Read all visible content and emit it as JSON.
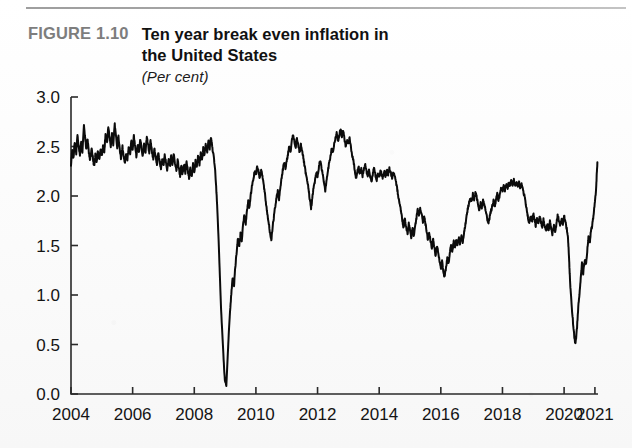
{
  "figure": {
    "label": "FIGURE 1.10",
    "title_line1": "Ten year break even inflation in",
    "title_line2": "the United States",
    "units": "(Per cent)"
  },
  "colors": {
    "line": "#0b0b0b",
    "axis": "#2a2a2a",
    "label_gray": "#7d7d7d",
    "text": "#111111",
    "background": "#fdfdfd"
  },
  "chart_data": {
    "type": "line",
    "title": "Ten year break even inflation in the United States",
    "subtitle": "(Per cent)",
    "xlabel": "",
    "ylabel": "Per cent",
    "xlim": [
      2004,
      2021.1
    ],
    "ylim": [
      0.0,
      3.0
    ],
    "yticks": [
      0.0,
      0.5,
      1.0,
      1.5,
      2.0,
      2.5,
      3.0
    ],
    "ytick_labels": [
      "0.0",
      "0.5",
      "1.0",
      "1.5",
      "2.0",
      "2.5",
      "3.0"
    ],
    "xticks": [
      2004,
      2006,
      2008,
      2010,
      2012,
      2014,
      2016,
      2018,
      2020,
      2021
    ],
    "xtick_labels": [
      "2004",
      "2006",
      "2008",
      "2010",
      "2012",
      "2014",
      "2016",
      "2018",
      "2020",
      "2021"
    ],
    "grid": false,
    "legend": false,
    "series": [
      {
        "name": "Ten year break even inflation",
        "units": "per cent",
        "x": [
          2004.0,
          2004.04,
          2004.08,
          2004.12,
          2004.17,
          2004.21,
          2004.25,
          2004.29,
          2004.33,
          2004.37,
          2004.42,
          2004.46,
          2004.5,
          2004.54,
          2004.58,
          2004.62,
          2004.67,
          2004.71,
          2004.75,
          2004.79,
          2004.83,
          2004.87,
          2004.92,
          2004.96,
          2005.0,
          2005.04,
          2005.08,
          2005.12,
          2005.17,
          2005.21,
          2005.25,
          2005.29,
          2005.33,
          2005.37,
          2005.42,
          2005.46,
          2005.5,
          2005.54,
          2005.58,
          2005.62,
          2005.67,
          2005.71,
          2005.75,
          2005.79,
          2005.83,
          2005.87,
          2005.92,
          2005.96,
          2006.0,
          2006.04,
          2006.08,
          2006.12,
          2006.17,
          2006.21,
          2006.25,
          2006.29,
          2006.33,
          2006.37,
          2006.42,
          2006.46,
          2006.5,
          2006.54,
          2006.58,
          2006.62,
          2006.67,
          2006.71,
          2006.75,
          2006.79,
          2006.83,
          2006.87,
          2006.92,
          2006.96,
          2007.0,
          2007.04,
          2007.08,
          2007.12,
          2007.17,
          2007.21,
          2007.25,
          2007.29,
          2007.33,
          2007.37,
          2007.42,
          2007.46,
          2007.5,
          2007.54,
          2007.58,
          2007.62,
          2007.67,
          2007.71,
          2007.75,
          2007.79,
          2007.83,
          2007.87,
          2007.92,
          2007.96,
          2008.0,
          2008.04,
          2008.08,
          2008.12,
          2008.17,
          2008.21,
          2008.25,
          2008.29,
          2008.33,
          2008.37,
          2008.42,
          2008.46,
          2008.5,
          2008.54,
          2008.58,
          2008.62,
          2008.67,
          2008.71,
          2008.75,
          2008.79,
          2008.83,
          2008.87,
          2008.92,
          2008.96,
          2009.0,
          2009.04,
          2009.08,
          2009.12,
          2009.17,
          2009.21,
          2009.25,
          2009.29,
          2009.33,
          2009.37,
          2009.42,
          2009.46,
          2009.5,
          2009.54,
          2009.58,
          2009.62,
          2009.67,
          2009.71,
          2009.75,
          2009.79,
          2009.83,
          2009.87,
          2009.92,
          2009.96,
          2010.0,
          2010.04,
          2010.08,
          2010.12,
          2010.17,
          2010.21,
          2010.25,
          2010.29,
          2010.33,
          2010.37,
          2010.42,
          2010.46,
          2010.5,
          2010.54,
          2010.58,
          2010.62,
          2010.67,
          2010.71,
          2010.75,
          2010.79,
          2010.83,
          2010.87,
          2010.92,
          2010.96,
          2011.0,
          2011.04,
          2011.08,
          2011.12,
          2011.17,
          2011.21,
          2011.25,
          2011.29,
          2011.33,
          2011.37,
          2011.42,
          2011.46,
          2011.5,
          2011.54,
          2011.58,
          2011.62,
          2011.67,
          2011.71,
          2011.75,
          2011.79,
          2011.83,
          2011.87,
          2011.92,
          2011.96,
          2012.0,
          2012.04,
          2012.08,
          2012.12,
          2012.17,
          2012.21,
          2012.25,
          2012.29,
          2012.33,
          2012.37,
          2012.42,
          2012.46,
          2012.5,
          2012.54,
          2012.58,
          2012.62,
          2012.67,
          2012.71,
          2012.75,
          2012.79,
          2012.83,
          2012.87,
          2012.92,
          2012.96,
          2013.0,
          2013.04,
          2013.08,
          2013.12,
          2013.17,
          2013.21,
          2013.25,
          2013.29,
          2013.33,
          2013.37,
          2013.42,
          2013.46,
          2013.5,
          2013.54,
          2013.58,
          2013.62,
          2013.67,
          2013.71,
          2013.75,
          2013.79,
          2013.83,
          2013.87,
          2013.92,
          2013.96,
          2014.0,
          2014.04,
          2014.08,
          2014.12,
          2014.17,
          2014.21,
          2014.25,
          2014.29,
          2014.33,
          2014.37,
          2014.42,
          2014.46,
          2014.5,
          2014.54,
          2014.58,
          2014.62,
          2014.67,
          2014.71,
          2014.75,
          2014.79,
          2014.83,
          2014.87,
          2014.92,
          2014.96,
          2015.0,
          2015.04,
          2015.08,
          2015.12,
          2015.17,
          2015.21,
          2015.25,
          2015.29,
          2015.33,
          2015.37,
          2015.42,
          2015.46,
          2015.5,
          2015.54,
          2015.58,
          2015.62,
          2015.67,
          2015.71,
          2015.75,
          2015.79,
          2015.83,
          2015.87,
          2015.92,
          2015.96,
          2016.0,
          2016.04,
          2016.08,
          2016.12,
          2016.17,
          2016.21,
          2016.25,
          2016.29,
          2016.33,
          2016.37,
          2016.42,
          2016.46,
          2016.5,
          2016.54,
          2016.58,
          2016.62,
          2016.67,
          2016.71,
          2016.75,
          2016.79,
          2016.83,
          2016.87,
          2016.92,
          2016.96,
          2017.0,
          2017.04,
          2017.08,
          2017.12,
          2017.17,
          2017.21,
          2017.25,
          2017.29,
          2017.33,
          2017.37,
          2017.42,
          2017.46,
          2017.5,
          2017.54,
          2017.58,
          2017.62,
          2017.67,
          2017.71,
          2017.75,
          2017.79,
          2017.83,
          2017.87,
          2017.92,
          2017.96,
          2018.0,
          2018.04,
          2018.08,
          2018.12,
          2018.17,
          2018.21,
          2018.25,
          2018.29,
          2018.33,
          2018.37,
          2018.42,
          2018.46,
          2018.5,
          2018.54,
          2018.58,
          2018.62,
          2018.67,
          2018.71,
          2018.75,
          2018.79,
          2018.83,
          2018.87,
          2018.92,
          2018.96,
          2019.0,
          2019.04,
          2019.08,
          2019.12,
          2019.17,
          2019.21,
          2019.25,
          2019.29,
          2019.33,
          2019.37,
          2019.42,
          2019.46,
          2019.5,
          2019.54,
          2019.58,
          2019.62,
          2019.67,
          2019.71,
          2019.75,
          2019.79,
          2019.83,
          2019.87,
          2019.92,
          2019.96,
          2020.0,
          2020.04,
          2020.08,
          2020.12,
          2020.14,
          2020.16,
          2020.18,
          2020.21,
          2020.25,
          2020.29,
          2020.33,
          2020.37,
          2020.42,
          2020.46,
          2020.5,
          2020.54,
          2020.58,
          2020.62,
          2020.67,
          2020.71,
          2020.75,
          2020.79,
          2020.83,
          2020.87,
          2020.92,
          2020.96,
          2021.0,
          2021.04,
          2021.06,
          2021.08
        ],
        "y": [
          2.32,
          2.46,
          2.38,
          2.55,
          2.42,
          2.62,
          2.5,
          2.4,
          2.55,
          2.44,
          2.72,
          2.58,
          2.47,
          2.58,
          2.44,
          2.36,
          2.48,
          2.38,
          2.3,
          2.42,
          2.33,
          2.45,
          2.37,
          2.47,
          2.4,
          2.52,
          2.44,
          2.62,
          2.54,
          2.7,
          2.6,
          2.5,
          2.62,
          2.52,
          2.72,
          2.6,
          2.48,
          2.6,
          2.48,
          2.38,
          2.5,
          2.4,
          2.32,
          2.44,
          2.36,
          2.5,
          2.42,
          2.56,
          2.48,
          2.6,
          2.5,
          2.4,
          2.52,
          2.44,
          2.58,
          2.48,
          2.4,
          2.52,
          2.44,
          2.6,
          2.52,
          2.44,
          2.56,
          2.46,
          2.38,
          2.48,
          2.4,
          2.32,
          2.44,
          2.36,
          2.28,
          2.38,
          2.3,
          2.42,
          2.34,
          2.26,
          2.38,
          2.3,
          2.4,
          2.32,
          2.42,
          2.34,
          2.26,
          2.36,
          2.28,
          2.2,
          2.3,
          2.22,
          2.32,
          2.24,
          2.34,
          2.26,
          2.18,
          2.28,
          2.2,
          2.32,
          2.24,
          2.36,
          2.28,
          2.4,
          2.32,
          2.44,
          2.36,
          2.48,
          2.4,
          2.52,
          2.44,
          2.56,
          2.48,
          2.6,
          2.5,
          2.42,
          2.3,
          2.1,
          1.85,
          1.55,
          1.2,
          0.85,
          0.55,
          0.3,
          0.12,
          0.08,
          0.35,
          0.62,
          0.88,
          1.05,
          1.18,
          1.1,
          1.28,
          1.42,
          1.58,
          1.5,
          1.62,
          1.55,
          1.7,
          1.8,
          1.72,
          1.85,
          1.95,
          1.88,
          2.0,
          2.1,
          2.18,
          2.25,
          2.22,
          2.3,
          2.26,
          2.18,
          2.28,
          2.2,
          2.12,
          2.02,
          1.92,
          1.82,
          1.72,
          1.62,
          1.56,
          1.68,
          1.78,
          1.88,
          1.98,
          2.05,
          1.96,
          2.08,
          2.18,
          2.26,
          2.34,
          2.28,
          2.36,
          2.42,
          2.5,
          2.44,
          2.56,
          2.62,
          2.54,
          2.48,
          2.58,
          2.52,
          2.44,
          2.52,
          2.46,
          2.38,
          2.3,
          2.22,
          2.14,
          2.06,
          1.96,
          1.88,
          1.98,
          2.08,
          2.16,
          2.24,
          2.2,
          2.28,
          2.36,
          2.3,
          2.22,
          2.14,
          2.06,
          2.16,
          2.24,
          2.32,
          2.4,
          2.48,
          2.44,
          2.52,
          2.58,
          2.64,
          2.56,
          2.62,
          2.68,
          2.6,
          2.66,
          2.58,
          2.5,
          2.56,
          2.52,
          2.58,
          2.5,
          2.42,
          2.34,
          2.26,
          2.18,
          2.24,
          2.3,
          2.22,
          2.28,
          2.2,
          2.26,
          2.32,
          2.26,
          2.2,
          2.26,
          2.2,
          2.14,
          2.22,
          2.28,
          2.22,
          2.16,
          2.22,
          2.2,
          2.26,
          2.22,
          2.18,
          2.24,
          2.2,
          2.26,
          2.22,
          2.28,
          2.24,
          2.18,
          2.24,
          2.2,
          2.14,
          2.08,
          2.0,
          1.92,
          1.84,
          1.76,
          1.68,
          1.78,
          1.7,
          1.62,
          1.72,
          1.66,
          1.58,
          1.68,
          1.6,
          1.7,
          1.78,
          1.86,
          1.8,
          1.88,
          1.82,
          1.74,
          1.8,
          1.72,
          1.64,
          1.56,
          1.62,
          1.54,
          1.46,
          1.56,
          1.48,
          1.4,
          1.5,
          1.42,
          1.34,
          1.26,
          1.34,
          1.24,
          1.18,
          1.28,
          1.38,
          1.32,
          1.42,
          1.5,
          1.44,
          1.54,
          1.48,
          1.56,
          1.5,
          1.58,
          1.52,
          1.6,
          1.54,
          1.62,
          1.7,
          1.78,
          1.86,
          1.94,
          1.98,
          1.94,
          2.02,
          1.96,
          2.04,
          1.98,
          1.92,
          1.86,
          1.94,
          1.88,
          1.96,
          1.9,
          1.84,
          1.78,
          1.72,
          1.78,
          1.84,
          1.9,
          1.96,
          1.9,
          1.96,
          2.02,
          1.96,
          2.02,
          2.08,
          2.04,
          2.1,
          2.06,
          2.12,
          2.08,
          2.14,
          2.1,
          2.16,
          2.12,
          2.16,
          2.1,
          2.14,
          2.1,
          2.14,
          2.08,
          2.12,
          2.06,
          2.0,
          1.94,
          1.86,
          1.78,
          1.72,
          1.8,
          1.74,
          1.82,
          1.76,
          1.7,
          1.78,
          1.72,
          1.8,
          1.74,
          1.68,
          1.76,
          1.7,
          1.64,
          1.72,
          1.66,
          1.74,
          1.68,
          1.62,
          1.7,
          1.64,
          1.72,
          1.8,
          1.76,
          1.7,
          1.78,
          1.72,
          1.8,
          1.74,
          1.68,
          1.6,
          1.5,
          1.38,
          1.22,
          1.05,
          0.88,
          0.72,
          0.58,
          0.5,
          0.68,
          0.88,
          1.02,
          1.18,
          1.32,
          1.22,
          1.36,
          1.3,
          1.44,
          1.58,
          1.52,
          1.64,
          1.72,
          1.82,
          1.94,
          2.08,
          2.22,
          2.34
        ]
      }
    ]
  },
  "axes": {
    "plot_left_px": 71,
    "plot_right_px": 598,
    "plot_top_px": 97,
    "plot_bottom_px": 394
  }
}
